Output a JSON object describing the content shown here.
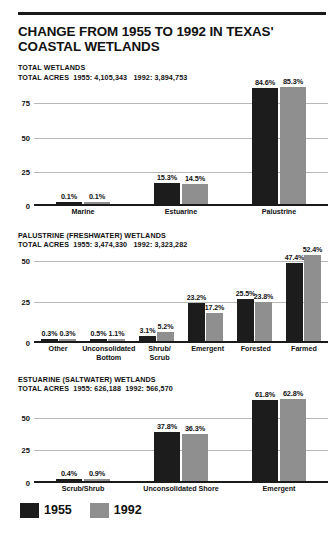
{
  "title": "CHANGE FROM 1955 TO 1992 IN TEXAS' COASTAL WETLANDS",
  "colors": {
    "series_1955": "#1c1c1c",
    "series_1992": "#8f8f8f",
    "text": "#111111",
    "gridline": "#b8b8b8"
  },
  "legend": {
    "items": [
      {
        "label": "1955",
        "color": "#1c1c1c"
      },
      {
        "label": "1992",
        "color": "#8f8f8f"
      }
    ]
  },
  "panels": [
    {
      "title": "TOTAL WETLANDS",
      "subtitle": "TOTAL ACRES  1955: 4,105,343   1992: 3,894,753"
    },
    {
      "title": "PALUSTRINE (FRESHWATER) WETLANDS",
      "subtitle": "TOTAL ACRES  1955: 3,474,330   1992: 3,323,282"
    },
    {
      "title": "ESTUARINE (SALTWATER) WETLANDS",
      "subtitle": "TOTAL ACRES  1955: 626,188  1992: 566,570"
    }
  ],
  "chart_data": [
    {
      "type": "bar",
      "title": "TOTAL WETLANDS",
      "subtitle": "TOTAL ACRES  1955: 4,105,343   1992: 3,894,753",
      "categories": [
        "Marine",
        "Estuarine",
        "Palustrine"
      ],
      "series": [
        {
          "name": "1955",
          "color": "#1c1c1c",
          "values": [
            0.1,
            15.3,
            84.6
          ],
          "labels": [
            "0.1%",
            "15.3%",
            "84.6%"
          ]
        },
        {
          "name": "1992",
          "color": "#8f8f8f",
          "values": [
            0.1,
            14.5,
            85.3
          ],
          "labels": [
            "0.1%",
            "14.5%",
            "85.3%"
          ]
        }
      ],
      "yticks": [
        0,
        25,
        50,
        75
      ],
      "ylim": [
        0,
        88
      ],
      "ylabel": "",
      "xlabel": "",
      "grid": true,
      "legend_position": "bottom"
    },
    {
      "type": "bar",
      "title": "PALUSTRINE (FRESHWATER) WETLANDS",
      "subtitle": "TOTAL ACRES  1955: 3,474,330   1992: 3,323,282",
      "categories": [
        "Other",
        "Unconsolidated\nBottom",
        "Shrub/\nScrub",
        "Emergent",
        "Forested",
        "Farmed"
      ],
      "series": [
        {
          "name": "1955",
          "color": "#1c1c1c",
          "values": [
            0.3,
            0.5,
            3.1,
            23.2,
            25.5,
            47.4
          ],
          "labels": [
            "0.3%",
            "0.5%",
            "3.1%",
            "23.2%",
            "25.5%",
            "47.4%"
          ]
        },
        {
          "name": "1992",
          "color": "#8f8f8f",
          "values": [
            0.3,
            1.1,
            5.2,
            17.2,
            23.8,
            52.4
          ],
          "labels": [
            "0.3%",
            "1.1%",
            "5.2%",
            "17.2%",
            "23.8%",
            "52.4%"
          ]
        }
      ],
      "yticks": [
        0,
        25,
        50
      ],
      "ylim": [
        0,
        55
      ],
      "ylabel": "",
      "xlabel": "",
      "grid": true,
      "legend_position": "bottom"
    },
    {
      "type": "bar",
      "title": "ESTUARINE (SALTWATER) WETLANDS",
      "subtitle": "TOTAL ACRES  1955: 626,188  1992: 566,570",
      "categories": [
        "Scrub/Shrub",
        "Unconsolidated Shore",
        "Emergent"
      ],
      "series": [
        {
          "name": "1955",
          "color": "#1c1c1c",
          "values": [
            0.4,
            37.8,
            61.8
          ],
          "labels": [
            "0.4%",
            "37.8%",
            "61.8%"
          ]
        },
        {
          "name": "1992",
          "color": "#8f8f8f",
          "values": [
            0.9,
            36.3,
            62.8
          ],
          "labels": [
            "0.9%",
            "36.3%",
            "62.8%"
          ]
        }
      ],
      "yticks": [
        0,
        25,
        50
      ],
      "ylim": [
        0,
        66
      ],
      "ylabel": "",
      "xlabel": "",
      "grid": true,
      "legend_position": "bottom"
    }
  ]
}
